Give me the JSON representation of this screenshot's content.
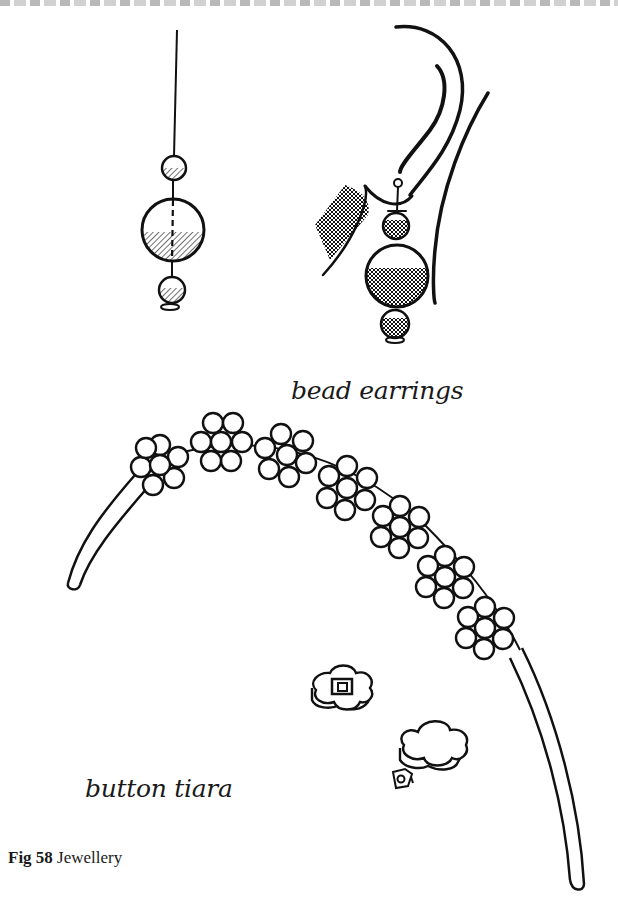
{
  "page": {
    "figure_number": "Fig 58",
    "figure_title": "Jewellery"
  },
  "illustrations": {
    "earrings": {
      "label": "bead earrings",
      "items": [
        "single-bead-earring",
        "earring-worn-on-ear"
      ]
    },
    "tiara": {
      "label": "button tiara",
      "items": [
        "tiara-headband-with-button-flowers",
        "loose-flower-button-with-shank",
        "loose-flower-button",
        "button-shank"
      ]
    }
  },
  "colors": {
    "ink": "#111111",
    "paper": "#ffffff"
  }
}
